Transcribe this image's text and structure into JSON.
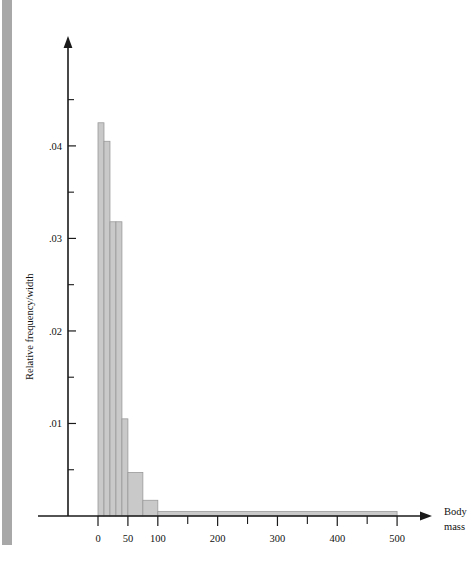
{
  "chart_data": {
    "type": "bar",
    "title": "",
    "subtitle": "",
    "xlabel": "Body mass",
    "xlabel_lines": [
      "Body",
      "mass"
    ],
    "ylabel": "Relative frequency/width",
    "xlim": [
      0,
      560
    ],
    "ylim": [
      0,
      0.0495
    ],
    "grid": false,
    "legend": null,
    "x_ticks_major": [
      0,
      50,
      100,
      200,
      300,
      400,
      500
    ],
    "x_tick_labels": [
      "0",
      "50",
      "100",
      "200",
      "300",
      "400",
      "500"
    ],
    "x_ticks_minor": [
      150,
      250,
      350,
      450
    ],
    "y_ticks_major": [
      0.01,
      0.02,
      0.03,
      0.04
    ],
    "y_tick_labels": [
      ".01",
      ".02",
      ".03",
      ".04"
    ],
    "y_ticks_minor": [
      0.005,
      0.015,
      0.025,
      0.035,
      0.045
    ],
    "bin_edges": [
      0,
      10,
      20,
      30,
      40,
      50,
      75,
      100,
      500
    ],
    "values": [
      0.0425,
      0.0405,
      0.0318,
      0.0318,
      0.0105,
      0.0047,
      0.0017,
      0.0005
    ],
    "bars": [
      {
        "x0": 0,
        "x1": 10,
        "y": 0.0425
      },
      {
        "x0": 10,
        "x1": 20,
        "y": 0.0405
      },
      {
        "x0": 20,
        "x1": 30,
        "y": 0.0318
      },
      {
        "x0": 30,
        "x1": 40,
        "y": 0.0318
      },
      {
        "x0": 40,
        "x1": 50,
        "y": 0.0105
      },
      {
        "x0": 50,
        "x1": 75,
        "y": 0.0047
      },
      {
        "x0": 75,
        "x1": 100,
        "y": 0.0017
      },
      {
        "x0": 100,
        "x1": 500,
        "y": 0.0005
      }
    ],
    "colors": {
      "bar_fill": "#c9c9c9",
      "bar_stroke": "#9a9a9a",
      "axis": "#1a1a1a",
      "text": "#111111",
      "page_edge": "#a8a8a8"
    }
  }
}
